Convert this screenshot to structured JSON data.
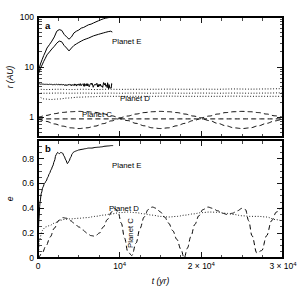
{
  "figure": {
    "width": 299,
    "height": 300,
    "background": "#ffffff",
    "ink": "#000000"
  },
  "panels": {
    "a": {
      "label": "a",
      "ylabel": "r (AU)",
      "ytick_labels": [
        "100",
        "10",
        "1"
      ],
      "annotations": [
        "Planet E",
        "Planet D",
        "Planet C"
      ]
    },
    "b": {
      "label": "b",
      "ylabel": "e",
      "ytick_labels": [
        "0.8",
        "0.6",
        "0.4",
        "0.2",
        "0"
      ],
      "annotations": [
        "Planet E",
        "Planet D",
        "Planet C"
      ]
    }
  },
  "xaxis": {
    "title": "t (yr)",
    "tick_labels": [
      "0",
      "10",
      "2 × 10",
      "3 × 10"
    ],
    "tick_exponents": [
      "",
      "4",
      "4",
      "4"
    ],
    "tick_values": [
      0,
      10000,
      20000,
      30000
    ],
    "range": [
      0,
      30000
    ]
  },
  "chart_data": [
    {
      "type": "line",
      "panel": "a",
      "title": "",
      "xlabel": "t (yr)",
      "ylabel": "r (AU)",
      "xlim": [
        0,
        30000
      ],
      "ylim": [
        0.4,
        100
      ],
      "yscale": "log",
      "xscale": "linear",
      "grid": false,
      "legend": "inline-annotations",
      "yticks": [
        1,
        10,
        100
      ],
      "ytick_labels": [
        "1",
        "10",
        "100"
      ],
      "series": [
        {
          "name": "Planet E apoapsis",
          "label": "Planet E",
          "style": "solid",
          "x": [
            0,
            150,
            300,
            500,
            700,
            900,
            1100,
            1400,
            1700,
            2000,
            2300,
            2600,
            2900,
            3200,
            3500,
            3800,
            4100,
            4400,
            4700,
            5000,
            5300,
            5600,
            5900,
            6200,
            6500,
            6800,
            7100,
            7400,
            7700,
            8000,
            8300,
            8600,
            8900,
            9100
          ],
          "y": [
            8.0,
            9.5,
            11.5,
            14.0,
            17.0,
            20.0,
            24.0,
            28.0,
            33.0,
            40.0,
            52.0,
            56.0,
            54.0,
            45.0,
            40.0,
            36.0,
            40.0,
            48.0,
            52.0,
            55.0,
            60.0,
            62.0,
            66.0,
            70.0,
            72.0,
            76.0,
            80.0,
            84.0,
            88.0,
            92.0,
            95.0,
            97.0,
            99.0,
            98.0
          ]
        },
        {
          "name": "Planet E mean distance",
          "label": "Planet E",
          "style": "solid",
          "x": [
            0,
            150,
            300,
            500,
            700,
            900,
            1100,
            1400,
            1700,
            2000,
            2300,
            2600,
            2900,
            3200,
            3500,
            3800,
            4100,
            4400,
            4700,
            5000,
            5300,
            5600,
            5900,
            6200,
            6500,
            6800,
            7100,
            7400,
            7700,
            8000,
            8300,
            8600,
            8900,
            9100
          ],
          "y": [
            7.0,
            8.0,
            9.5,
            11.0,
            13.0,
            15.0,
            17.5,
            20.0,
            23.0,
            26.0,
            30.0,
            33.0,
            32.0,
            27.0,
            24.0,
            21.0,
            24.0,
            27.0,
            29.0,
            31.0,
            33.0,
            35.0,
            36.5,
            38.0,
            40.0,
            42.0,
            43.5,
            45.0,
            46.5,
            48.0,
            49.5,
            51.0,
            52.0,
            50.0
          ]
        },
        {
          "name": "Planet E periapsis",
          "label": "Planet E",
          "style": "solid-noisy",
          "x": [
            0,
            400,
            900,
            1500,
            2200,
            3000,
            3800,
            4600,
            5400,
            6200,
            7000,
            7800,
            8500,
            9100
          ],
          "y": [
            4.6,
            4.55,
            4.5,
            4.5,
            4.45,
            4.45,
            4.4,
            4.4,
            4.4,
            4.4,
            4.35,
            4.35,
            4.35,
            4.3
          ],
          "noise_amplitude": 0.5
        },
        {
          "name": "Planet D apoapsis",
          "label": "Planet D",
          "style": "dotted",
          "x": [
            0,
            1000,
            2500,
            4000,
            5500,
            7000,
            8500,
            10000,
            12000,
            14000,
            16000,
            18000,
            20000,
            22000,
            24000,
            26000,
            28000,
            30000
          ],
          "y": [
            3.6,
            3.55,
            3.6,
            3.55,
            3.6,
            3.55,
            3.6,
            3.58,
            3.6,
            3.6,
            3.62,
            3.6,
            3.62,
            3.6,
            3.65,
            3.62,
            3.65,
            3.7
          ]
        },
        {
          "name": "Planet D mean distance",
          "label": "Planet D",
          "style": "dotted",
          "x": [
            0,
            1000,
            2500,
            4000,
            5500,
            7000,
            8500,
            10000,
            12000,
            14000,
            16000,
            18000,
            20000,
            22000,
            24000,
            26000,
            28000,
            30000
          ],
          "y": [
            3.0,
            3.0,
            3.02,
            3.0,
            3.02,
            3.0,
            3.02,
            3.0,
            3.02,
            3.0,
            3.02,
            3.0,
            3.02,
            3.0,
            3.02,
            3.0,
            3.02,
            3.05
          ]
        },
        {
          "name": "Planet D periapsis",
          "label": "Planet D",
          "style": "dotted",
          "x": [
            0,
            800,
            1600,
            2600,
            3600,
            5000,
            6500,
            8000,
            10000,
            12000,
            14000,
            16000,
            18000,
            20000,
            22000,
            24000,
            26000,
            28000,
            30000
          ],
          "y": [
            2.55,
            2.3,
            2.25,
            2.3,
            2.4,
            2.5,
            2.55,
            2.6,
            2.6,
            2.6,
            2.6,
            2.62,
            2.6,
            2.6,
            2.6,
            2.62,
            2.6,
            2.6,
            2.6
          ]
        },
        {
          "name": "Planet C apoapsis",
          "label": "Planet C",
          "style": "dashed",
          "x": [
            0,
            1000,
            2000,
            3000,
            4000,
            5000,
            6000,
            7000,
            8000,
            9000,
            10000,
            11000,
            12000,
            13000,
            14000,
            15000,
            16000,
            17000,
            18000,
            19000,
            20000,
            21000,
            22000,
            23000,
            24000,
            25000,
            26000,
            27000,
            28000,
            29000,
            30000
          ],
          "y": [
            1.0,
            1.08,
            1.17,
            1.24,
            1.28,
            1.3,
            1.28,
            1.24,
            1.16,
            1.06,
            0.97,
            1.05,
            1.15,
            1.23,
            1.28,
            1.3,
            1.28,
            1.23,
            1.15,
            1.05,
            0.97,
            1.05,
            1.15,
            1.23,
            1.28,
            1.3,
            1.28,
            1.23,
            1.15,
            1.06,
            1.0
          ]
        },
        {
          "name": "Planet C mean distance",
          "label": "Planet C",
          "style": "dashed",
          "x": [
            0,
            5000,
            10000,
            15000,
            20000,
            25000,
            30000
          ],
          "y": [
            0.92,
            0.92,
            0.92,
            0.92,
            0.92,
            0.92,
            0.92
          ]
        },
        {
          "name": "Planet C periapsis",
          "label": "Planet C",
          "style": "dashed",
          "x": [
            0,
            1000,
            2000,
            3000,
            4000,
            5000,
            6000,
            7000,
            8000,
            9000,
            10000,
            11000,
            12000,
            13000,
            14000,
            15000,
            16000,
            17000,
            18000,
            19000,
            20000,
            21000,
            22000,
            23000,
            24000,
            25000,
            26000,
            27000,
            28000,
            29000,
            30000
          ],
          "y": [
            0.9,
            0.82,
            0.73,
            0.66,
            0.61,
            0.59,
            0.61,
            0.66,
            0.74,
            0.84,
            0.93,
            0.85,
            0.75,
            0.67,
            0.61,
            0.59,
            0.61,
            0.67,
            0.75,
            0.85,
            0.93,
            0.85,
            0.75,
            0.67,
            0.61,
            0.59,
            0.61,
            0.67,
            0.75,
            0.84,
            0.9
          ]
        }
      ]
    },
    {
      "type": "line",
      "panel": "b",
      "title": "",
      "xlabel": "t (yr)",
      "ylabel": "e",
      "xlim": [
        0,
        30000
      ],
      "ylim": [
        0,
        0.95
      ],
      "yscale": "linear",
      "xscale": "linear",
      "grid": false,
      "legend": "inline-annotations",
      "yticks": [
        0,
        0.2,
        0.4,
        0.6,
        0.8
      ],
      "ytick_labels": [
        "0",
        "0.2",
        "0.4",
        "0.6",
        "0.8"
      ],
      "series": [
        {
          "name": "Planet E eccentricity",
          "label": "Planet E",
          "style": "solid",
          "x": [
            0,
            100,
            250,
            400,
            600,
            800,
            1000,
            1200,
            1400,
            1600,
            1800,
            2000,
            2200,
            2400,
            2600,
            2800,
            3000,
            3200,
            3400,
            3600,
            3800,
            4000,
            4200,
            4400,
            4600,
            4800,
            5000,
            5400,
            5800,
            6200,
            6600,
            7000,
            7400,
            7800,
            8200,
            8600,
            9000,
            9200
          ],
          "y": [
            0.1,
            0.3,
            0.45,
            0.52,
            0.57,
            0.6,
            0.62,
            0.65,
            0.68,
            0.71,
            0.74,
            0.78,
            0.83,
            0.85,
            0.84,
            0.85,
            0.845,
            0.82,
            0.79,
            0.76,
            0.78,
            0.81,
            0.84,
            0.855,
            0.86,
            0.865,
            0.87,
            0.875,
            0.88,
            0.885,
            0.885,
            0.89,
            0.892,
            0.895,
            0.9,
            0.902,
            0.905,
            0.905
          ]
        },
        {
          "name": "Planet D eccentricity",
          "label": "Planet D",
          "style": "dotted",
          "x": [
            0,
            200,
            500,
            900,
            1400,
            2000,
            2600,
            3200,
            4000,
            5000,
            6000,
            7000,
            8000,
            9000,
            10000,
            11000,
            12000,
            13000,
            14000,
            15000,
            16000,
            17000,
            18000,
            19000,
            20000,
            21000,
            22000,
            23000,
            24000,
            25000,
            26000,
            27000,
            28000,
            29000,
            30000
          ],
          "y": [
            0.02,
            0.15,
            0.22,
            0.25,
            0.26,
            0.28,
            0.3,
            0.31,
            0.315,
            0.32,
            0.325,
            0.335,
            0.345,
            0.355,
            0.365,
            0.37,
            0.365,
            0.355,
            0.345,
            0.335,
            0.33,
            0.335,
            0.345,
            0.355,
            0.365,
            0.37,
            0.368,
            0.36,
            0.35,
            0.34,
            0.335,
            0.335,
            0.33,
            0.31,
            0.3
          ]
        },
        {
          "name": "Planet C eccentricity",
          "label": "Planet C",
          "style": "dashed",
          "x": [
            0,
            500,
            1000,
            1500,
            2000,
            2500,
            3000,
            3500,
            4000,
            4500,
            5000,
            5500,
            6000,
            6500,
            7000,
            7500,
            8000,
            8500,
            9000,
            9400,
            9800,
            10200,
            10600,
            11000,
            11500,
            12000,
            12500,
            13000,
            13500,
            14000,
            14500,
            15000,
            15500,
            16000,
            16500,
            17000,
            17500,
            17900,
            18300,
            18700,
            19200,
            19700,
            20200,
            20800,
            21400,
            22000,
            22600,
            23200,
            23800,
            24400,
            25000,
            25400,
            25800,
            26200,
            26800,
            27400,
            28000,
            28600,
            29200,
            29800,
            30000
          ],
          "y": [
            0.0,
            0.04,
            0.1,
            0.17,
            0.24,
            0.3,
            0.325,
            0.32,
            0.3,
            0.275,
            0.25,
            0.225,
            0.2,
            0.18,
            0.175,
            0.2,
            0.25,
            0.31,
            0.37,
            0.4,
            0.37,
            0.28,
            0.16,
            0.05,
            0.02,
            0.12,
            0.24,
            0.33,
            0.39,
            0.41,
            0.4,
            0.37,
            0.33,
            0.28,
            0.22,
            0.15,
            0.07,
            0.0,
            0.08,
            0.17,
            0.27,
            0.34,
            0.39,
            0.41,
            0.4,
            0.38,
            0.36,
            0.35,
            0.36,
            0.38,
            0.4,
            0.39,
            0.3,
            0.18,
            0.04,
            0.06,
            0.18,
            0.3,
            0.37,
            0.4,
            0.4
          ]
        }
      ]
    }
  ]
}
